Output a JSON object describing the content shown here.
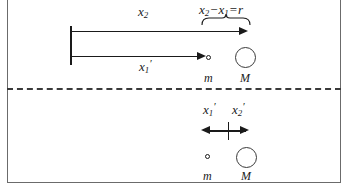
{
  "figure": {
    "colors": {
      "line": "#1a1a1a",
      "frame": "#6b6b6b",
      "divider": "#3a3a3a",
      "background": "#ffffff"
    }
  },
  "top_panel": {
    "name": "lab-frame-panel",
    "labels": {
      "x2": "x",
      "x2_sub": "2",
      "x1_prime": "x",
      "x1_prime_sub": "1",
      "x1_prime_mark": "′",
      "mass_small": "m",
      "mass_large": "M"
    },
    "expression": {
      "term1": "x",
      "term1_sub": "2",
      "operator": "−",
      "term2": "x",
      "term2_sub": "1",
      "equals": "=",
      "result": "r"
    },
    "arrows": [
      {
        "name": "x2-arrow",
        "from_x": 70,
        "to_x": 248,
        "y": 31
      },
      {
        "name": "x1-prime-arrow",
        "from_x": 70,
        "to_x": 205,
        "y": 56
      }
    ],
    "origin_bar": {
      "x": 70,
      "top": 26,
      "bottom": 65
    },
    "bodies": [
      {
        "name": "small-mass",
        "label": "m",
        "cx": 209,
        "cy": 58,
        "size": "small"
      },
      {
        "name": "large-mass",
        "label": "M",
        "cx": 245,
        "cy": 58,
        "size": "large"
      }
    ]
  },
  "bottom_panel": {
    "name": "center-of-mass-frame-panel",
    "labels": {
      "x1_prime": "x",
      "x1_prime_sub": "1",
      "x1_prime_mark": "′",
      "x2_prime": "x",
      "x2_prime_sub": "2",
      "x2_prime_mark": "′",
      "mass_small": "m",
      "mass_large": "M"
    },
    "double_arrow": {
      "name": "cm-double-arrow",
      "left_x": 202,
      "right_x": 248,
      "center_x": 228,
      "y": 130
    },
    "bodies": [
      {
        "name": "small-mass",
        "label": "m",
        "cx": 207,
        "cy": 156,
        "size": "small"
      },
      {
        "name": "large-mass",
        "label": "M",
        "cx": 246,
        "cy": 157,
        "size": "large"
      }
    ]
  }
}
